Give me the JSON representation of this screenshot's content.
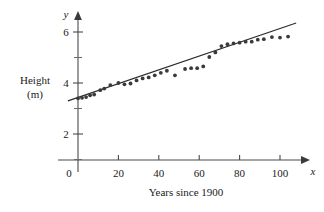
{
  "chart_data": {
    "type": "scatter",
    "title": "",
    "xlabel": "Years since 1900",
    "ylabel": "Height (m)",
    "ylabel_line1": "Height",
    "ylabel_line2": "(m)",
    "x_axis_variable": "x",
    "y_axis_variable": "y",
    "xlim": [
      -8,
      112
    ],
    "ylim": [
      0,
      6.8
    ],
    "xticks": [
      0,
      20,
      40,
      60,
      80,
      100
    ],
    "xtick_labels": [
      "0",
      "20",
      "40",
      "60",
      "80",
      "100"
    ],
    "yticks": [
      2,
      4,
      6
    ],
    "ytick_labels": [
      "2",
      "4",
      "6"
    ],
    "y_minor_ticks": [
      1,
      3,
      5
    ],
    "grid": false,
    "legend": null,
    "marker_color": "#3a3a3a",
    "line_color": "#2b2b2b",
    "axis_color": "#4a4a4a",
    "points": [
      {
        "x": 0,
        "y": 3.4
      },
      {
        "x": 2,
        "y": 3.42
      },
      {
        "x": 4,
        "y": 3.45
      },
      {
        "x": 6,
        "y": 3.52
      },
      {
        "x": 8,
        "y": 3.55
      },
      {
        "x": 11,
        "y": 3.72
      },
      {
        "x": 13,
        "y": 3.78
      },
      {
        "x": 16,
        "y": 3.92
      },
      {
        "x": 20,
        "y": 4.0
      },
      {
        "x": 23,
        "y": 3.95
      },
      {
        "x": 26,
        "y": 3.98
      },
      {
        "x": 29,
        "y": 4.1
      },
      {
        "x": 32,
        "y": 4.18
      },
      {
        "x": 35,
        "y": 4.22
      },
      {
        "x": 38,
        "y": 4.3
      },
      {
        "x": 41,
        "y": 4.4
      },
      {
        "x": 44,
        "y": 4.48
      },
      {
        "x": 48,
        "y": 4.3
      },
      {
        "x": 53,
        "y": 4.55
      },
      {
        "x": 56,
        "y": 4.58
      },
      {
        "x": 59,
        "y": 4.58
      },
      {
        "x": 62,
        "y": 4.65
      },
      {
        "x": 65,
        "y": 5.02
      },
      {
        "x": 68,
        "y": 5.2
      },
      {
        "x": 71,
        "y": 5.45
      },
      {
        "x": 74,
        "y": 5.52
      },
      {
        "x": 77,
        "y": 5.55
      },
      {
        "x": 80,
        "y": 5.58
      },
      {
        "x": 83,
        "y": 5.62
      },
      {
        "x": 86,
        "y": 5.62
      },
      {
        "x": 89,
        "y": 5.7
      },
      {
        "x": 92,
        "y": 5.72
      },
      {
        "x": 96,
        "y": 5.8
      },
      {
        "x": 100,
        "y": 5.78
      },
      {
        "x": 104,
        "y": 5.82
      }
    ],
    "trend_line": {
      "x1": -5,
      "y1": 3.3,
      "x2": 108,
      "y2": 6.35
    }
  }
}
